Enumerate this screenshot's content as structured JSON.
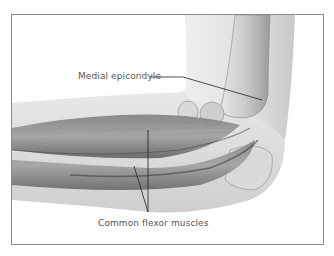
{
  "diagram": {
    "labels": [
      {
        "id": "medial-epicondyle",
        "text": "Medial epicondyle"
      },
      {
        "id": "common-flexor-muscles",
        "text": "Common flexor muscles"
      }
    ],
    "colors": {
      "frame_border": "#8a8a8a",
      "skin_fill": "#e4e4e4",
      "bone_fill": "#d2d2d2",
      "muscle_dark": "#555555",
      "label_text": "#555555",
      "leader_line": "#222222"
    }
  }
}
